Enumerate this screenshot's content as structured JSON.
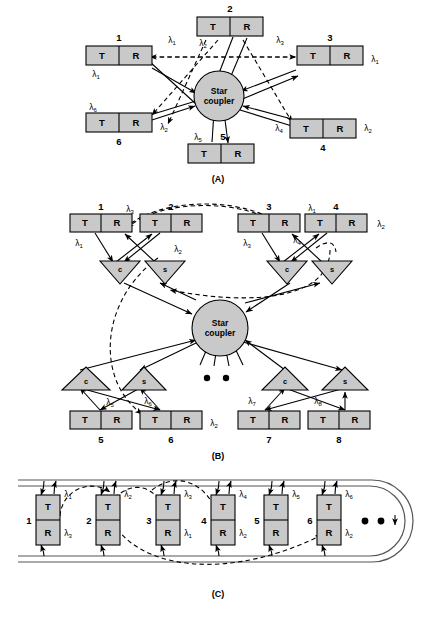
{
  "figure": {
    "captions": {
      "a": "(A)",
      "b": "(B)",
      "c": "(C)"
    },
    "coupler_label_line1": "Star",
    "coupler_label_line2": "coupler",
    "transmitter_label": "T",
    "receiver_label": "R",
    "combiner_label": "c",
    "splitter_label": "s",
    "lambda_symbol": "λ"
  },
  "panel_a": {
    "caption": "(A)",
    "type": "single-hop-star",
    "coupler": {
      "line1": "Star",
      "line2": "coupler"
    },
    "nodes": [
      {
        "id": "1",
        "number": "1",
        "tx": "T",
        "rx": "R",
        "tx_lambda": "1",
        "rx_lambda": "1",
        "num_pos": "above"
      },
      {
        "id": "2",
        "number": "2",
        "tx": "T",
        "rx": "R",
        "tx_lambda": "2",
        "rx_lambda": "",
        "num_pos": "above"
      },
      {
        "id": "3",
        "number": "3",
        "tx": "T",
        "rx": "R",
        "tx_lambda": "3",
        "rx_lambda": "1",
        "num_pos": "above"
      },
      {
        "id": "4",
        "number": "4",
        "tx": "T",
        "rx": "R",
        "tx_lambda": "4",
        "rx_lambda": "2",
        "num_pos": "below"
      },
      {
        "id": "5",
        "number": "5",
        "tx": "T",
        "rx": "R",
        "tx_lambda": "5",
        "rx_lambda": "",
        "num_pos": "above"
      },
      {
        "id": "6",
        "number": "6",
        "tx": "T",
        "rx": "R",
        "tx_lambda": "6",
        "rx_lambda": "2",
        "num_pos": "below"
      }
    ]
  },
  "panel_b": {
    "caption": "(B)",
    "type": "multi-hop-star-with-combiners",
    "coupler": {
      "line1": "Star",
      "line2": "coupler"
    },
    "ellipsis_dots": 2,
    "nodes": [
      {
        "id": "1",
        "number": "1",
        "tx": "T",
        "rx": "R",
        "tx_lambda": "1",
        "rx_lambda": "3",
        "row": "top"
      },
      {
        "id": "2",
        "number": "2",
        "tx": "T",
        "rx": "R",
        "tx_lambda": "2",
        "rx_lambda": "",
        "row": "top"
      },
      {
        "id": "3",
        "number": "3",
        "tx": "T",
        "rx": "R",
        "tx_lambda": "3",
        "rx_lambda": "1",
        "row": "top"
      },
      {
        "id": "4",
        "number": "4",
        "tx": "T",
        "rx": "R",
        "tx_lambda": "4",
        "rx_lambda": "2",
        "row": "top"
      },
      {
        "id": "5",
        "number": "5",
        "tx": "T",
        "rx": "R",
        "tx_lambda": "5",
        "rx_lambda": "",
        "row": "bottom"
      },
      {
        "id": "6",
        "number": "6",
        "tx": "T",
        "rx": "R",
        "tx_lambda": "6",
        "rx_lambda": "2",
        "row": "bottom"
      },
      {
        "id": "7",
        "number": "7",
        "tx": "T",
        "rx": "R",
        "tx_lambda": "7",
        "rx_lambda": "",
        "row": "bottom"
      },
      {
        "id": "8",
        "number": "8",
        "tx": "T",
        "rx": "R",
        "tx_lambda": "8",
        "rx_lambda": "",
        "row": "bottom"
      }
    ],
    "couplers_small": [
      {
        "id": "c1",
        "label": "c",
        "row": "top"
      },
      {
        "id": "s1",
        "label": "s",
        "row": "top"
      },
      {
        "id": "c2",
        "label": "c",
        "row": "top"
      },
      {
        "id": "s2",
        "label": "s",
        "row": "top"
      },
      {
        "id": "c3",
        "label": "c",
        "row": "bottom"
      },
      {
        "id": "s3",
        "label": "s",
        "row": "bottom"
      },
      {
        "id": "c4",
        "label": "c",
        "row": "bottom"
      },
      {
        "id": "s4",
        "label": "s",
        "row": "bottom"
      }
    ]
  },
  "panel_c": {
    "caption": "(C)",
    "type": "bus-ring",
    "ellipsis_dots": 2,
    "nodes": [
      {
        "id": "1",
        "number": "1",
        "tx": "T",
        "rx": "R",
        "tx_lambda": "1",
        "rx_lambda": "3"
      },
      {
        "id": "2",
        "number": "2",
        "tx": "T",
        "rx": "R",
        "tx_lambda": "2",
        "rx_lambda": ""
      },
      {
        "id": "3",
        "number": "3",
        "tx": "T",
        "rx": "R",
        "tx_lambda": "3",
        "rx_lambda": "1"
      },
      {
        "id": "4",
        "number": "4",
        "tx": "T",
        "rx": "R",
        "tx_lambda": "4",
        "rx_lambda": "2"
      },
      {
        "id": "5",
        "number": "5",
        "tx": "T",
        "rx": "R",
        "tx_lambda": "5",
        "rx_lambda": ""
      },
      {
        "id": "6",
        "number": "6",
        "tx": "T",
        "rx": "R",
        "tx_lambda": "6",
        "rx_lambda": "2"
      }
    ]
  },
  "colors": {
    "box_fill": "#c9c9c9",
    "stroke": "#000000",
    "background": "#ffffff",
    "ring": "#555555"
  }
}
